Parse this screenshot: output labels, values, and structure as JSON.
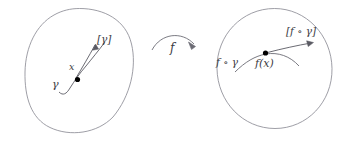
{
  "figure": {
    "background_color": "#ffffff",
    "ink_color": "#4a4a52",
    "point_color": "#000000"
  },
  "source_disc": {
    "name": "source-manifold",
    "curve_label": "γ",
    "point_label": "x",
    "tangent_label": "[γ]"
  },
  "map": {
    "label": "f"
  },
  "target_disc": {
    "name": "target-manifold",
    "curve_label": "f ∘ γ",
    "point_label": "f(x)",
    "tangent_label": "[f ∘ γ]"
  }
}
